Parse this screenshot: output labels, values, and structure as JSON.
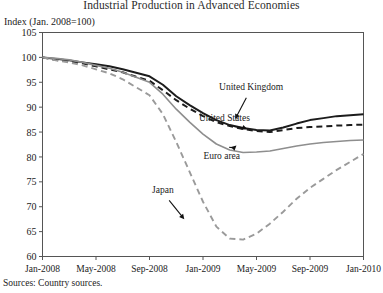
{
  "chart_data": {
    "type": "line",
    "title": "Industrial Production in Advanced Economies",
    "ylabel": "Index (Jan. 2008=100)",
    "xlabel": "",
    "ylim": [
      60,
      105
    ],
    "yticks": [
      60,
      65,
      70,
      75,
      80,
      85,
      90,
      95,
      100,
      105
    ],
    "xticks": [
      "Jan-2008",
      "May-2008",
      "Sep-2008",
      "Jan-2009",
      "May-2009",
      "Sep-2009",
      "Jan-2010"
    ],
    "xlim": [
      0,
      24
    ],
    "grid": false,
    "legend": "inline-annotations",
    "source": "Sources: Country sources.",
    "x": [
      0,
      1,
      2,
      3,
      4,
      5,
      6,
      7,
      8,
      9,
      10,
      11,
      12,
      13,
      14,
      15,
      16,
      17,
      18,
      19,
      20,
      21,
      22,
      23,
      24
    ],
    "series": [
      {
        "name": "United States",
        "color": "#1c1c1c",
        "style": "solid",
        "width": 2.0,
        "label_x": 14.3,
        "label_y": 87.2,
        "values": [
          100.0,
          99.7,
          99.4,
          99.0,
          98.6,
          98.2,
          97.6,
          96.9,
          96.2,
          94.5,
          92.2,
          90.4,
          88.8,
          87.4,
          86.4,
          85.8,
          85.4,
          85.3,
          85.9,
          86.7,
          87.4,
          87.8,
          88.2,
          88.4,
          88.6
        ]
      },
      {
        "name": "United Kingdom",
        "color": "#1c1c1c",
        "style": "dashed",
        "width": 2.0,
        "label_x": 15.6,
        "label_y": 93.5,
        "values": [
          100.0,
          99.5,
          99.2,
          98.8,
          98.2,
          97.6,
          97.0,
          96.1,
          95.3,
          93.4,
          91.4,
          89.7,
          88.2,
          87.0,
          86.2,
          85.6,
          85.2,
          85.0,
          85.4,
          85.8,
          86.0,
          86.1,
          86.3,
          86.4,
          86.5
        ]
      },
      {
        "name": "Euro area",
        "color": "#8e8e8e",
        "style": "solid",
        "width": 1.6,
        "label_x": 13.6,
        "label_y": 79.5,
        "values": [
          100.0,
          99.8,
          99.5,
          99.0,
          98.4,
          97.8,
          97.0,
          96.0,
          95.0,
          92.6,
          89.6,
          87.0,
          84.6,
          82.6,
          81.4,
          80.9,
          81.0,
          81.2,
          81.7,
          82.2,
          82.6,
          82.9,
          83.1,
          83.3,
          83.4
        ]
      },
      {
        "name": "Japan",
        "color": "#9a9a9a",
        "style": "dashed",
        "width": 1.9,
        "label_x": 9.4,
        "label_y": 73.0,
        "values": [
          100.0,
          99.4,
          99.0,
          98.4,
          97.6,
          96.8,
          95.6,
          94.0,
          92.4,
          88.6,
          83.0,
          77.0,
          71.0,
          66.0,
          63.6,
          63.4,
          64.6,
          66.6,
          69.0,
          71.6,
          73.8,
          75.6,
          77.4,
          79.0,
          80.6
        ]
      }
    ],
    "annotations": [
      {
        "text": "United Kingdom",
        "tx": 15.6,
        "ty": 93.5,
        "ax": 14.4,
        "ay": 87.6
      },
      {
        "text": "United States",
        "tx": 13.6,
        "ty": 87.3,
        "ax": 15.3,
        "ay": 85.6
      },
      {
        "text": "Euro area",
        "tx": 13.4,
        "ty": 79.6,
        "ax": 14.5,
        "ay": 82.3
      },
      {
        "text": "Japan",
        "tx": 9.0,
        "ty": 72.8,
        "ax": 10.6,
        "ay": 67.5
      }
    ]
  }
}
